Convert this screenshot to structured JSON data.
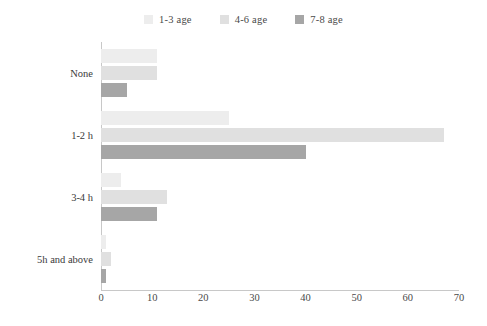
{
  "chart_data": {
    "type": "bar",
    "orientation": "horizontal",
    "title": "",
    "xlabel": "",
    "ylabel": "",
    "categories": [
      "None",
      "1-2 h",
      "3-4 h",
      "5h and above"
    ],
    "series": [
      {
        "name": "1-3 age",
        "color": "#ededed",
        "values": [
          11,
          25,
          4,
          1
        ]
      },
      {
        "name": "4-6 age",
        "color": "#e0e0e0",
        "values": [
          11,
          67,
          13,
          2
        ]
      },
      {
        "name": "7-8 age",
        "color": "#a6a6a6",
        "values": [
          5,
          40,
          11,
          1
        ]
      }
    ],
    "xlim": [
      0,
      70
    ],
    "xticks": [
      0,
      10,
      20,
      30,
      40,
      50,
      60,
      70
    ],
    "xtick_labels": [
      "0",
      "10",
      "20",
      "30",
      "40",
      "50",
      "60",
      "70"
    ],
    "grid": false,
    "legend_position": "top-center",
    "axis_color": "#c8c8c8",
    "text_color": "#3a3a3a"
  },
  "legend": {
    "items": [
      {
        "label": "1-3 age",
        "swatch": "legend-swatch-1-3-age"
      },
      {
        "label": "4-6 age",
        "swatch": "legend-swatch-4-6-age"
      },
      {
        "label": "7-8 age",
        "swatch": "legend-swatch-7-8-age"
      }
    ]
  }
}
